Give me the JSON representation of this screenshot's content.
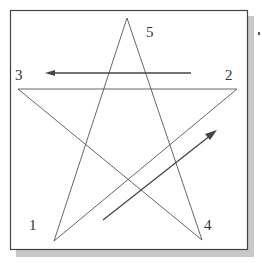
{
  "diagram": {
    "type": "pentagram-stroke-order",
    "colors": {
      "frame": "#444444",
      "shadow": "#c8c8c8",
      "star_line": "#555555",
      "arrow": "#444444",
      "label": "#333333",
      "background": "#ffffff"
    },
    "vertices": [
      {
        "id": "1",
        "label": "1",
        "x": 54,
        "y": 241
      },
      {
        "id": "2",
        "label": "2",
        "x": 237,
        "y": 89
      },
      {
        "id": "3",
        "label": "3",
        "x": 18,
        "y": 89
      },
      {
        "id": "4",
        "label": "4",
        "x": 202,
        "y": 240
      },
      {
        "id": "5",
        "label": "5",
        "x": 127,
        "y": 18
      }
    ],
    "labels": [
      {
        "text": "5",
        "x": 146,
        "y": 37
      },
      {
        "text": "3",
        "x": 15,
        "y": 80
      },
      {
        "text": "2",
        "x": 225,
        "y": 80
      },
      {
        "text": "1",
        "x": 29,
        "y": 230
      },
      {
        "text": "4",
        "x": 204,
        "y": 230
      }
    ],
    "arrows": [
      {
        "name": "arrow-leftward",
        "from": [
          191,
          73
        ],
        "to": [
          46,
          73
        ]
      },
      {
        "name": "arrow-up-right",
        "from": [
          103,
          220
        ],
        "to": [
          216,
          131
        ]
      }
    ]
  }
}
